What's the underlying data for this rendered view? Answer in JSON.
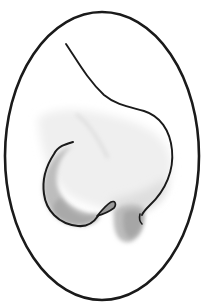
{
  "illustration": {
    "subject": "nose side profile sketch in oval frame",
    "background_color": "#ffffff",
    "stroke_color": "#1a1a1a",
    "shading_light": "#e4e4e4",
    "shading_mid": "#c4c4c4",
    "shading_dark": "#a8a8a8",
    "frame": {
      "shape": "ellipse",
      "cx": 102,
      "cy": 156,
      "rx": 97,
      "ry": 144
    }
  }
}
